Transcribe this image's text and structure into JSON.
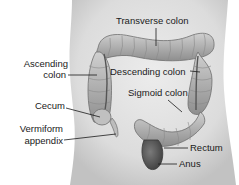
{
  "diagram": {
    "labels": {
      "transverse_colon": "Transverse colon",
      "ascending_colon_line1": "Ascending",
      "ascending_colon_line2": "colon",
      "descending_colon": "Descending colon",
      "sigmoid_colon": "Sigmoid colon",
      "cecum": "Cecum",
      "vermiform_appendix_line1": "Vermiform",
      "vermiform_appendix_line2": "appendix",
      "rectum": "Rectum",
      "anus": "Anus"
    },
    "colors": {
      "torso_fill": "#e2e2e2",
      "torso_shadow": "#c4c4c4",
      "colon_fill": "#b8b8b8",
      "colon_dark": "#6e6e6e",
      "rectum_fill": "#5a5a5a",
      "leader_line": "#1a1a1a"
    }
  }
}
